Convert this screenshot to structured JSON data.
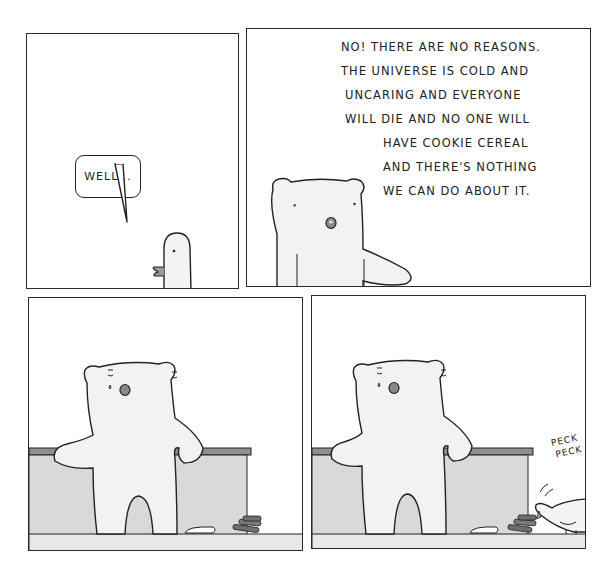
{
  "comic": {
    "panels": [
      {
        "id": 1,
        "speaker": "bird",
        "bubble_text": "WELL..."
      },
      {
        "id": 2,
        "speaker": "bear",
        "speech_lines": [
          "NO! THERE ARE NO REASONS.",
          "THE UNIVERSE IS COLD AND",
          "UNCARING AND EVERYONE",
          "WILL DIE AND NO ONE WILL",
          "HAVE COOKIE CEREAL",
          "AND THERE'S NOTHING",
          "WE CAN DO ABOUT IT."
        ]
      },
      {
        "id": 3,
        "speaker": "none",
        "description": "bear crying, leaning on counter"
      },
      {
        "id": 4,
        "speaker": "bird",
        "sfx_lines": [
          "PECK",
          "PECK"
        ]
      }
    ],
    "colors": {
      "line": "#222222",
      "bear_fill": "#f2f2f2",
      "counter_fill": "#d9d9d9",
      "counter_top": "#8f8f8f",
      "floor_fill": "#e8e8e8",
      "beak": "#9a9a9a",
      "cookies": "#6f6f6f"
    }
  }
}
